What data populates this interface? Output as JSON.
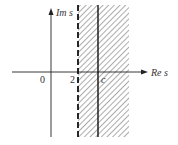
{
  "diagram": {
    "type": "complex-plane-region",
    "axes": {
      "x_label": "Re s",
      "y_label": "Im s",
      "origin_label": "0"
    },
    "markers": [
      {
        "label": "2",
        "style": "dashed",
        "x_value": 2
      },
      {
        "label": "c",
        "style": "solid",
        "x_value": "c"
      }
    ],
    "region": {
      "description": "Vertical strip with hatching, starting at dashed line Re s = 2 and extending right",
      "hatch": "diagonal"
    },
    "colors": {
      "line": "#222222",
      "hatch": "#555555",
      "background": "#ffffff"
    }
  }
}
